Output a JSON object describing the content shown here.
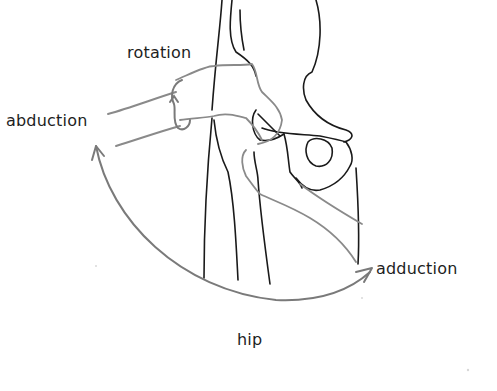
{
  "diagram": {
    "title": "hip",
    "labels": {
      "rotation": "rotation",
      "abduction": "abduction",
      "adduction": "adduction"
    },
    "colors": {
      "bone_outline": "#1a1a1a",
      "motion_arrows": "#7a7a7a",
      "limb_outline": "#8a8a8a",
      "background": "#ffffff"
    }
  }
}
